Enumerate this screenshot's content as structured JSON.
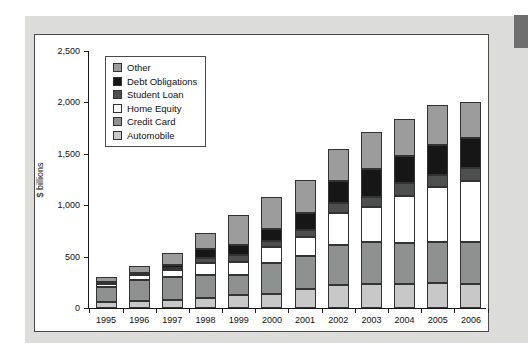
{
  "page": {
    "bg_color": "#ffffff",
    "mat_color": "#dcdddb",
    "corner_tab_color": "#6e6e6e"
  },
  "chart_data": {
    "type": "bar",
    "stacked": true,
    "title": "",
    "xlabel": "",
    "ylabel": "$ billions",
    "ylim": [
      0,
      2500
    ],
    "ytick_step": 500,
    "ytick_labels": [
      "0",
      "500",
      "1,000",
      "1,500",
      "2,000",
      "2,500"
    ],
    "grid": false,
    "legend_position": "top-left inside plot",
    "categories": [
      "1995",
      "1996",
      "1997",
      "1998",
      "1999",
      "2000",
      "2001",
      "2002",
      "2003",
      "2004",
      "2005",
      "2006"
    ],
    "series_bottom_to_top": [
      {
        "name": "Automobile",
        "color": "#c7c8c7",
        "values": [
          60,
          70,
          80,
          95,
          125,
          135,
          180,
          220,
          230,
          230,
          240,
          235
        ]
      },
      {
        "name": "Credit Card",
        "color": "#8f9090",
        "values": [
          140,
          205,
          220,
          225,
          200,
          305,
          330,
          395,
          415,
          400,
          400,
          405
        ]
      },
      {
        "name": "Home Equity",
        "color": "#ffffff",
        "values": [
          35,
          45,
          65,
          120,
          125,
          155,
          180,
          310,
          340,
          455,
          535,
          600
        ]
      },
      {
        "name": "Student Loan",
        "color": "#4d4e4e",
        "values": [
          10,
          10,
          25,
          50,
          70,
          55,
          65,
          95,
          90,
          130,
          120,
          125
        ]
      },
      {
        "name": "Debt Obligations",
        "color": "#161616",
        "values": [
          10,
          10,
          25,
          80,
          95,
          115,
          165,
          220,
          275,
          260,
          295,
          290
        ]
      },
      {
        "name": "Other",
        "color": "#9b9c9b",
        "values": [
          50,
          65,
          120,
          160,
          290,
          310,
          325,
          305,
          360,
          365,
          385,
          345
        ]
      }
    ],
    "totals_by_year": [
      305,
      405,
      535,
      730,
      905,
      1075,
      1245,
      1545,
      1710,
      1840,
      1975,
      2000
    ],
    "legend_order_top_to_bottom": [
      "Other",
      "Debt Obligations",
      "Student Loan",
      "Home Equity",
      "Credit Card",
      "Automobile"
    ]
  }
}
